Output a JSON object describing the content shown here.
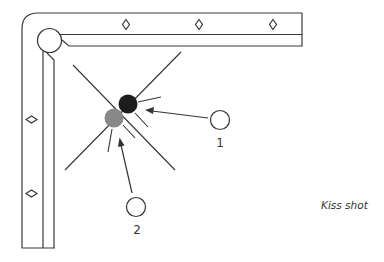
{
  "diagram": {
    "caption": "Kiss shot",
    "table": {
      "rail_color": "#3a3a3a",
      "top_rail_diamonds": 3,
      "left_rail_diamonds": 2,
      "corner_pocket": "top-left"
    },
    "balls": {
      "object_ball_black": {
        "color": "#1c1c1c"
      },
      "object_ball_gray": {
        "color": "#888888"
      },
      "cue_ball_1": {
        "label": "1",
        "color": "#ffffff"
      },
      "cue_ball_2": {
        "label": "2",
        "color": "#ffffff"
      }
    }
  }
}
